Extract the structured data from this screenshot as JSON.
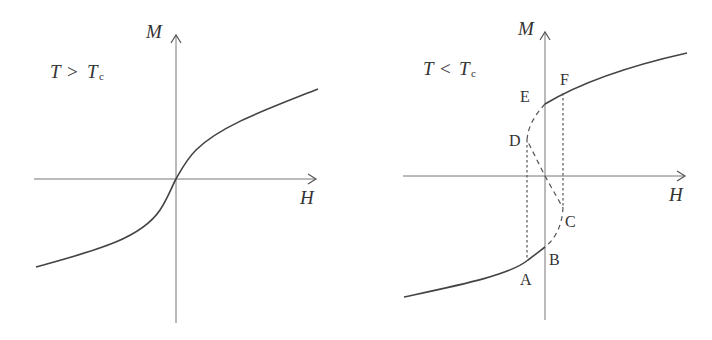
{
  "left_panel": {
    "condition_label": {
      "T": "T",
      "op": ">",
      "Tc": "T",
      "sub": "c"
    },
    "axis_y_label": "M",
    "axis_x_label": "H",
    "curve": "smooth S-shaped M(H) passing through origin (paramagnetic, no hysteresis)"
  },
  "right_panel": {
    "condition_label": {
      "T": "T",
      "op": "<",
      "Tc": "T",
      "sub": "c"
    },
    "axis_y_label": "M",
    "axis_x_label": "H",
    "points": {
      "A": "A",
      "B": "B",
      "C": "C",
      "D": "D",
      "E": "E",
      "F": "F"
    },
    "description": "Ferromagnetic M(H) with unstable branch E-D-O-C-B (dashed) and vertical jumps D-A and F-C (dotted)"
  },
  "colors": {
    "axis": "#777777",
    "curve": "#444444",
    "text": "#333333",
    "background": "#ffffff"
  }
}
